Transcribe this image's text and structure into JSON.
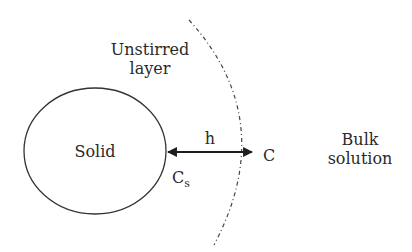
{
  "diagram": {
    "solid": {
      "label": "Solid"
    },
    "unstirred_layer": {
      "line1": "Unstirred",
      "line2": "layer"
    },
    "bulk": {
      "line1": "Bulk",
      "line2": "solution"
    },
    "thickness": {
      "label": "h"
    },
    "surface_conc": {
      "label": "C",
      "subscript": "s"
    },
    "bulk_conc": {
      "label": "C"
    },
    "colors": {
      "stroke": "#2a2a2a",
      "background": "#ffffff"
    }
  }
}
